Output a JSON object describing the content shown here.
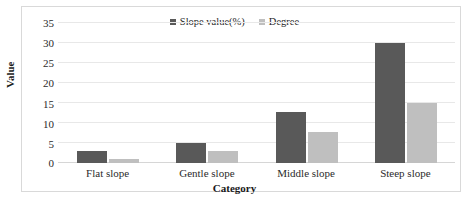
{
  "chart_data": {
    "type": "bar",
    "title": "",
    "subtitle": "",
    "xlabel": "Category",
    "ylabel": "Value",
    "categories": [
      "Flat slope",
      "Gentle slope",
      "Middle slope",
      "Steep slope"
    ],
    "series": [
      {
        "name": "Slope value(%)",
        "color": "#595959",
        "values": [
          3,
          5,
          12.8,
          30
        ]
      },
      {
        "name": "Degree",
        "color": "#bfbfbf",
        "values": [
          1,
          3,
          7.8,
          14.9
        ]
      }
    ],
    "ylim": [
      0,
      35
    ],
    "yticks": [
      0,
      5,
      10,
      15,
      20,
      25,
      30,
      35
    ],
    "ytick_labels": [
      "0",
      "5",
      "10",
      "15",
      "20",
      "25",
      "30",
      "35"
    ],
    "grid": true,
    "grid_axis": "y",
    "legend_position": "top-center",
    "orientation": "vertical",
    "grouping": "grouped",
    "border_color": "#d9d9d9",
    "gridline_color": "#e8e8e8",
    "background": "#ffffff"
  }
}
